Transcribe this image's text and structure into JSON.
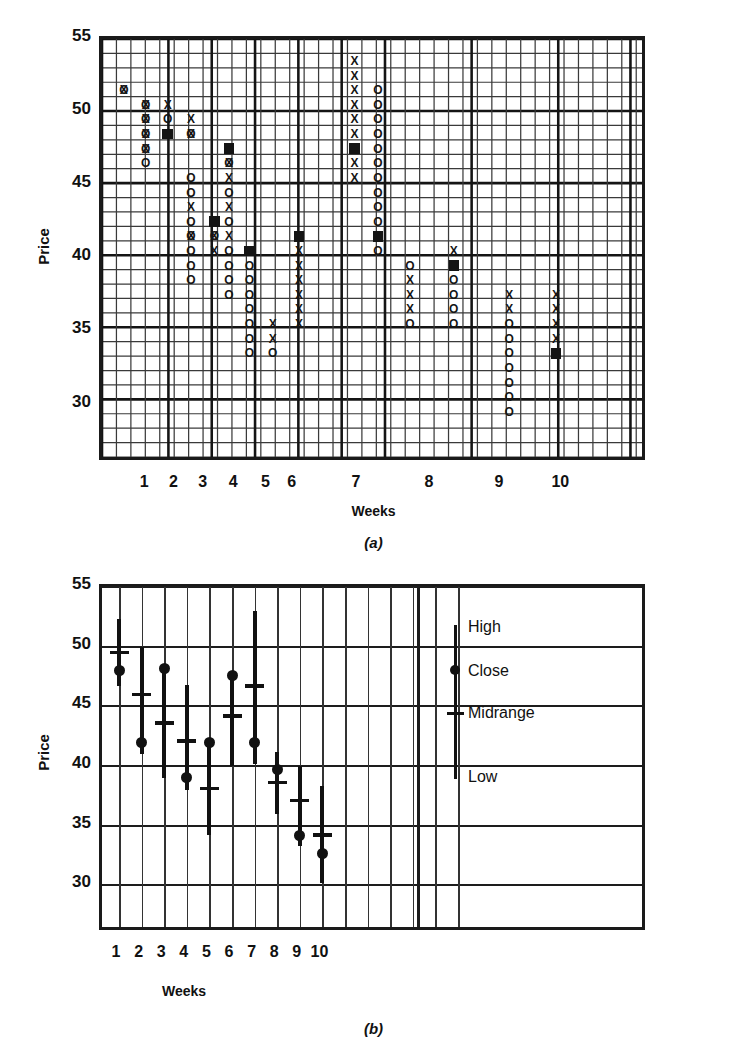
{
  "figure": {
    "panel_a_caption": "(a)",
    "panel_b_caption": "(b)"
  },
  "chart_data": [
    {
      "id": "panel-a",
      "type": "scatter",
      "subtype": "point-and-figure",
      "title": "",
      "xlabel": "Weeks",
      "ylabel": "Price",
      "ylim": [
        26,
        55
      ],
      "yticks": [
        30,
        35,
        40,
        45,
        50,
        55
      ],
      "xticks": [
        1,
        2,
        3,
        4,
        5,
        6,
        7,
        8,
        9,
        10
      ],
      "grid": true,
      "legend": "none",
      "cell_size_price": 1,
      "marker_types": [
        "X (advance)",
        "O (decline)",
        "filled square (weekly close)"
      ],
      "columns": [
        {
          "col": 0,
          "marks": [
            {
              "y": 51,
              "m": "O"
            },
            {
              "y": 51,
              "m": "X"
            }
          ]
        },
        {
          "col": 1,
          "marks": [
            {
              "y": 50,
              "m": "O"
            },
            {
              "y": 50,
              "m": "X"
            },
            {
              "y": 49,
              "m": "O"
            },
            {
              "y": 49,
              "m": "X"
            },
            {
              "y": 48,
              "m": "O"
            },
            {
              "y": 48,
              "m": "X"
            },
            {
              "y": 47,
              "m": "O"
            },
            {
              "y": 47,
              "m": "X"
            },
            {
              "y": 46,
              "m": "O"
            }
          ]
        },
        {
          "col": 2,
          "marks": [
            {
              "y": 50,
              "m": "X"
            },
            {
              "y": 49,
              "m": "O"
            },
            {
              "y": 48,
              "m": "FILL"
            }
          ]
        },
        {
          "col": 3,
          "marks": [
            {
              "y": 49,
              "m": "X"
            },
            {
              "y": 48,
              "m": "O"
            },
            {
              "y": 48,
              "m": "X"
            },
            {
              "y": 45,
              "m": "O"
            },
            {
              "y": 44,
              "m": "O"
            },
            {
              "y": 43,
              "m": "X"
            },
            {
              "y": 42,
              "m": "O"
            },
            {
              "y": 41,
              "m": "O"
            },
            {
              "y": 41,
              "m": "X"
            },
            {
              "y": 40,
              "m": "O"
            },
            {
              "y": 39,
              "m": "O"
            },
            {
              "y": 38,
              "m": "O"
            }
          ]
        },
        {
          "col": 4,
          "marks": [
            {
              "y": 42,
              "m": "X"
            },
            {
              "y": 41,
              "m": "O"
            },
            {
              "y": 41,
              "m": "X"
            },
            {
              "y": 40,
              "m": "X"
            },
            {
              "y": 42,
              "m": "FILL"
            }
          ]
        },
        {
          "col": 5,
          "marks": [
            {
              "y": 47,
              "m": "FILL"
            },
            {
              "y": 46,
              "m": "X"
            },
            {
              "y": 46,
              "m": "O"
            },
            {
              "y": 45,
              "m": "X"
            },
            {
              "y": 44,
              "m": "O"
            },
            {
              "y": 43,
              "m": "X"
            },
            {
              "y": 42,
              "m": "O"
            },
            {
              "y": 41,
              "m": "X"
            },
            {
              "y": 40,
              "m": "O"
            },
            {
              "y": 39,
              "m": "O"
            },
            {
              "y": 38,
              "m": "O"
            },
            {
              "y": 37,
              "m": "O"
            }
          ]
        },
        {
          "col": 6,
          "marks": [
            {
              "y": 40,
              "m": "FILL"
            },
            {
              "y": 39,
              "m": "O"
            },
            {
              "y": 38,
              "m": "O"
            },
            {
              "y": 37,
              "m": "O"
            },
            {
              "y": 36,
              "m": "O"
            },
            {
              "y": 35,
              "m": "O"
            },
            {
              "y": 34,
              "m": "O"
            },
            {
              "y": 33,
              "m": "O"
            }
          ]
        },
        {
          "col": 7,
          "marks": [
            {
              "y": 35,
              "m": "X"
            },
            {
              "y": 34,
              "m": "X"
            },
            {
              "y": 33,
              "m": "O"
            }
          ]
        },
        {
          "col": 8,
          "marks": [
            {
              "y": 41,
              "m": "FILL"
            },
            {
              "y": 40,
              "m": "X"
            },
            {
              "y": 39,
              "m": "X"
            },
            {
              "y": 38,
              "m": "X"
            },
            {
              "y": 37,
              "m": "X"
            },
            {
              "y": 36,
              "m": "X"
            },
            {
              "y": 35,
              "m": "X"
            }
          ]
        },
        {
          "col": 9,
          "marks": [
            {
              "y": 53,
              "m": "X"
            },
            {
              "y": 52,
              "m": "X"
            },
            {
              "y": 51,
              "m": "X"
            },
            {
              "y": 50,
              "m": "X"
            },
            {
              "y": 49,
              "m": "X"
            },
            {
              "y": 48,
              "m": "X"
            },
            {
              "y": 47,
              "m": "FILL"
            },
            {
              "y": 46,
              "m": "X"
            },
            {
              "y": 45,
              "m": "X"
            }
          ]
        },
        {
          "col": 10,
          "marks": [
            {
              "y": 51,
              "m": "O"
            },
            {
              "y": 50,
              "m": "O"
            },
            {
              "y": 49,
              "m": "O"
            },
            {
              "y": 48,
              "m": "O"
            },
            {
              "y": 47,
              "m": "O"
            },
            {
              "y": 46,
              "m": "O"
            },
            {
              "y": 45,
              "m": "O"
            },
            {
              "y": 44,
              "m": "O"
            },
            {
              "y": 43,
              "m": "O"
            },
            {
              "y": 42,
              "m": "O"
            },
            {
              "y": 41,
              "m": "FILL"
            },
            {
              "y": 40,
              "m": "O"
            }
          ]
        },
        {
          "col": 11,
          "marks": [
            {
              "y": 39,
              "m": "O"
            },
            {
              "y": 38,
              "m": "X"
            },
            {
              "y": 37,
              "m": "X"
            },
            {
              "y": 36,
              "m": "X"
            },
            {
              "y": 35,
              "m": "O"
            }
          ]
        },
        {
          "col": 12,
          "marks": [
            {
              "y": 40,
              "m": "X"
            },
            {
              "y": 39,
              "m": "FILL"
            },
            {
              "y": 38,
              "m": "O"
            },
            {
              "y": 37,
              "m": "O"
            },
            {
              "y": 36,
              "m": "O"
            },
            {
              "y": 35,
              "m": "O"
            }
          ]
        },
        {
          "col": 13,
          "marks": [
            {
              "y": 37,
              "m": "X"
            },
            {
              "y": 36,
              "m": "X"
            },
            {
              "y": 35,
              "m": "O"
            },
            {
              "y": 34,
              "m": "O"
            },
            {
              "y": 33,
              "m": "O"
            },
            {
              "y": 32,
              "m": "O"
            },
            {
              "y": 31,
              "m": "O"
            },
            {
              "y": 30,
              "m": "O"
            },
            {
              "y": 29,
              "m": "O"
            }
          ]
        },
        {
          "col": 14,
          "marks": [
            {
              "y": 37,
              "m": "X"
            },
            {
              "y": 36,
              "m": "X"
            },
            {
              "y": 35,
              "m": "X"
            },
            {
              "y": 34,
              "m": "X"
            },
            {
              "y": 33,
              "m": "FILL"
            }
          ]
        }
      ]
    },
    {
      "id": "panel-b",
      "type": "bar",
      "subtype": "high-low-close-midrange",
      "title": "",
      "xlabel": "Weeks",
      "ylabel": "Price",
      "ylim": [
        26,
        55
      ],
      "yticks": [
        30,
        35,
        40,
        45,
        50,
        55
      ],
      "categories": [
        1,
        2,
        3,
        4,
        5,
        6,
        7,
        8,
        9,
        10
      ],
      "grid": true,
      "legend_position": "right-inside",
      "legend_entries": [
        "High",
        "Close",
        "Midrange",
        "Low"
      ],
      "series": [
        {
          "name": "High",
          "values": [
            52.3,
            50.0,
            48.2,
            46.8,
            42.0,
            47.8,
            53.0,
            41.2,
            40.0,
            38.3
          ]
        },
        {
          "name": "Low",
          "values": [
            46.7,
            41.0,
            39.0,
            38.0,
            34.2,
            40.0,
            40.2,
            36.0,
            33.3,
            30.2
          ]
        },
        {
          "name": "Close",
          "values": [
            48.0,
            42.0,
            48.2,
            39.0,
            42.0,
            47.6,
            42.0,
            39.7,
            34.2,
            32.7
          ]
        },
        {
          "name": "Midrange",
          "values": [
            49.5,
            46.0,
            43.6,
            42.1,
            38.1,
            44.2,
            46.7,
            38.6,
            37.1,
            34.2
          ]
        }
      ]
    }
  ],
  "panel_a": {
    "ylabel": "Price",
    "xlabel": "Weeks",
    "yticks": [
      "55",
      "50",
      "45",
      "40",
      "35",
      "30"
    ],
    "xticks": [
      "1",
      "2",
      "3",
      "4",
      "5",
      "6",
      "7",
      "8",
      "9",
      "10"
    ]
  },
  "panel_b": {
    "ylabel": "Price",
    "xlabel": "Weeks",
    "yticks": [
      "55",
      "50",
      "45",
      "40",
      "35",
      "30"
    ],
    "xticks": [
      "1",
      "2",
      "3",
      "4",
      "5",
      "6",
      "7",
      "8",
      "9",
      "10"
    ],
    "legend": {
      "high": "High",
      "close": "Close",
      "midrange": "Midrange",
      "low": "Low"
    }
  },
  "colors": {
    "ink": "#141414",
    "grid": "#333333",
    "background": "#ffffff"
  }
}
